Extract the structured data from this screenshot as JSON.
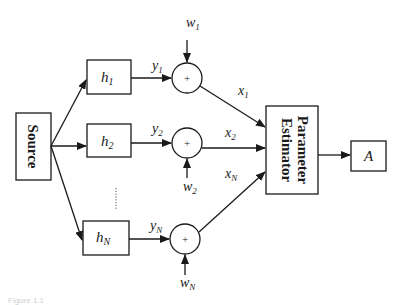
{
  "diagram": {
    "type": "block-diagram",
    "source": {
      "label": "Source"
    },
    "channels": [
      {
        "filter": "h",
        "filter_sub": "1",
        "output": "y",
        "output_sub": "1",
        "noise": "w",
        "noise_sub": "1",
        "sum_symbol": "+",
        "sum_output": "x",
        "sum_output_sub": "1"
      },
      {
        "filter": "h",
        "filter_sub": "2",
        "output": "y",
        "output_sub": "2",
        "noise": "w",
        "noise_sub": "2",
        "sum_symbol": "+",
        "sum_output": "x",
        "sum_output_sub": "2"
      },
      {
        "filter": "h",
        "filter_sub": "N",
        "output": "y",
        "output_sub": "N",
        "noise": "w",
        "noise_sub": "N",
        "sum_symbol": "+",
        "sum_output": "x",
        "sum_output_sub": "N"
      }
    ],
    "ellipsis": "......",
    "estimator": {
      "line1": "Parameter",
      "line2": "Estimator"
    },
    "output": {
      "label": "A"
    },
    "caption": "Figure 1.1"
  }
}
